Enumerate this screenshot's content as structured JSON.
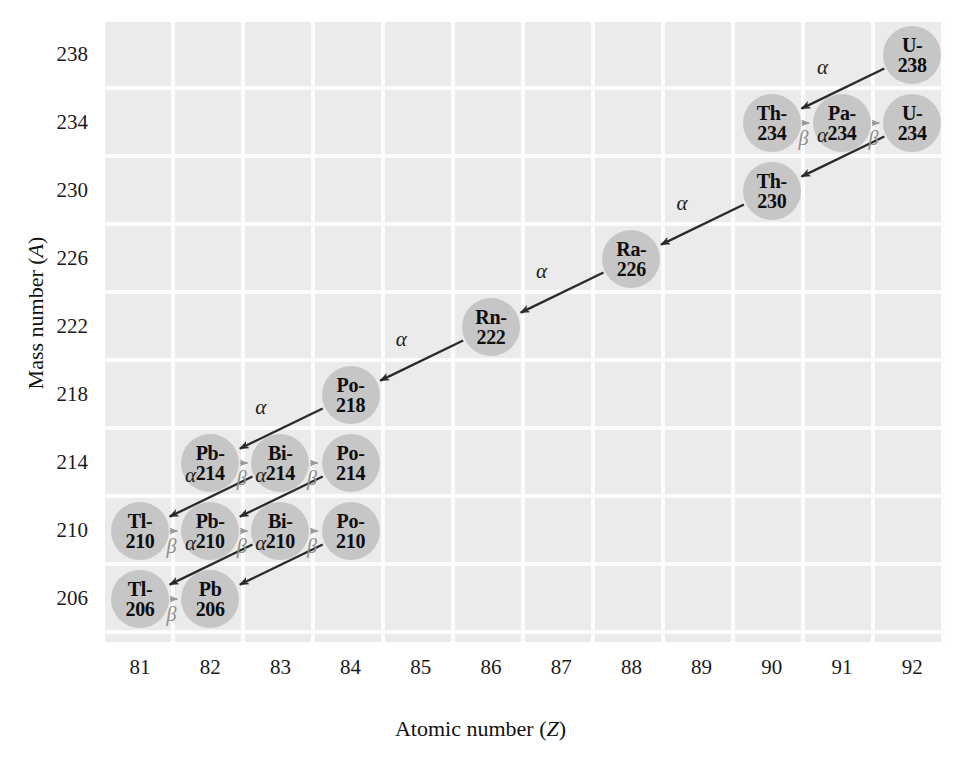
{
  "axes": {
    "x_label": "Atomic number (Z)",
    "x_label_plain": "Atomic number (",
    "x_label_italic": "Z",
    "y_label_plain": "Mass number (",
    "y_label_italic": "A",
    "x_ticks": [
      "81",
      "82",
      "83",
      "84",
      "85",
      "86",
      "87",
      "88",
      "89",
      "90",
      "91",
      "92"
    ],
    "y_ticks": [
      "238",
      "234",
      "230",
      "226",
      "222",
      "218",
      "214",
      "210",
      "206"
    ]
  },
  "colors": {
    "plot_background": "#ebebeb",
    "gridline": "#fdfdfd",
    "bubble": "#c6c6c6",
    "alpha_arrow": "#2a2a2a",
    "beta_arrow": "#9a9a9a",
    "text": "#0d0d0d"
  },
  "chart_data": {
    "type": "scatter",
    "xlabel": "Atomic number (Z)",
    "ylabel": "Mass number (A)",
    "xlim": [
      80.5,
      92.5
    ],
    "ylim": [
      204,
      240
    ],
    "grid": true,
    "legend": null,
    "nuclides": [
      {
        "id": "U-238",
        "element": "U-",
        "mass": "238",
        "z": 92,
        "a": 238
      },
      {
        "id": "Th-234",
        "element": "Th-",
        "mass": "234",
        "z": 90,
        "a": 234
      },
      {
        "id": "Pa-234",
        "element": "Pa-",
        "mass": "234",
        "z": 91,
        "a": 234
      },
      {
        "id": "U-234",
        "element": "U-",
        "mass": "234",
        "z": 92,
        "a": 234
      },
      {
        "id": "Th-230",
        "element": "Th-",
        "mass": "230",
        "z": 90,
        "a": 230
      },
      {
        "id": "Ra-226",
        "element": "Ra-",
        "mass": "226",
        "z": 88,
        "a": 226
      },
      {
        "id": "Rn-222",
        "element": "Rn-",
        "mass": "222",
        "z": 86,
        "a": 222
      },
      {
        "id": "Po-218",
        "element": "Po-",
        "mass": "218",
        "z": 84,
        "a": 218
      },
      {
        "id": "Pb-214",
        "element": "Pb-",
        "mass": "214",
        "z": 82,
        "a": 214
      },
      {
        "id": "Bi-214",
        "element": "Bi-",
        "mass": "214",
        "z": 83,
        "a": 214
      },
      {
        "id": "Po-214",
        "element": "Po-",
        "mass": "214",
        "z": 84,
        "a": 214
      },
      {
        "id": "Tl-210",
        "element": "Tl-",
        "mass": "210",
        "z": 81,
        "a": 210
      },
      {
        "id": "Pb-210",
        "element": "Pb-",
        "mass": "210",
        "z": 82,
        "a": 210
      },
      {
        "id": "Bi-210",
        "element": "Bi-",
        "mass": "210",
        "z": 83,
        "a": 210
      },
      {
        "id": "Po-210",
        "element": "Po-",
        "mass": "210",
        "z": 84,
        "a": 210
      },
      {
        "id": "Tl-206",
        "element": "Tl-",
        "mass": "206",
        "z": 81,
        "a": 206
      },
      {
        "id": "Pb-206",
        "element": "Pb",
        "mass": "206",
        "z": 82,
        "a": 206
      }
    ],
    "decays": [
      {
        "from": "U-238",
        "to": "Th-234",
        "type": "alpha",
        "symbol": "α"
      },
      {
        "from": "Th-234",
        "to": "Pa-234",
        "type": "beta",
        "symbol": "β"
      },
      {
        "from": "Pa-234",
        "to": "U-234",
        "type": "beta",
        "symbol": "β"
      },
      {
        "from": "U-234",
        "to": "Th-230",
        "type": "alpha",
        "symbol": "α"
      },
      {
        "from": "Th-230",
        "to": "Ra-226",
        "type": "alpha",
        "symbol": "α"
      },
      {
        "from": "Ra-226",
        "to": "Rn-222",
        "type": "alpha",
        "symbol": "α"
      },
      {
        "from": "Rn-222",
        "to": "Po-218",
        "type": "alpha",
        "symbol": "α"
      },
      {
        "from": "Po-218",
        "to": "Pb-214",
        "type": "alpha",
        "symbol": "α"
      },
      {
        "from": "Pb-214",
        "to": "Bi-214",
        "type": "beta",
        "symbol": "β"
      },
      {
        "from": "Bi-214",
        "to": "Po-214",
        "type": "beta",
        "symbol": "β"
      },
      {
        "from": "Bi-214",
        "to": "Tl-210",
        "type": "alpha",
        "symbol": "α"
      },
      {
        "from": "Po-214",
        "to": "Pb-210",
        "type": "alpha",
        "symbol": "α"
      },
      {
        "from": "Tl-210",
        "to": "Pb-210",
        "type": "beta",
        "symbol": "β"
      },
      {
        "from": "Pb-210",
        "to": "Bi-210",
        "type": "beta",
        "symbol": "β"
      },
      {
        "from": "Bi-210",
        "to": "Po-210",
        "type": "beta",
        "symbol": "β"
      },
      {
        "from": "Bi-210",
        "to": "Tl-206",
        "type": "alpha",
        "symbol": "α"
      },
      {
        "from": "Po-210",
        "to": "Pb-206",
        "type": "alpha",
        "symbol": "α"
      },
      {
        "from": "Tl-206",
        "to": "Pb-206",
        "type": "beta",
        "symbol": "β"
      }
    ]
  }
}
